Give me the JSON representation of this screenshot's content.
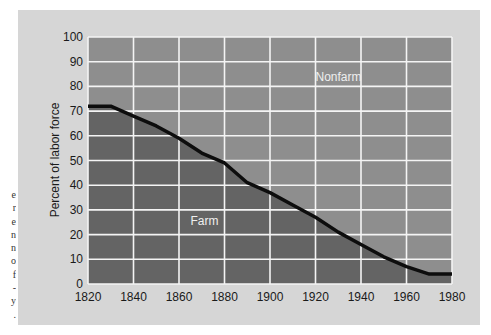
{
  "caption_fragment": [
    "e",
    "r",
    "e",
    "n",
    "n",
    "o",
    "f",
    "-",
    "y",
    "."
  ],
  "colors": {
    "panel_bg": "#d6d6d6",
    "nonfarm_fill": "#8e8e8e",
    "farm_fill": "#646464",
    "grid": "#f4f4f4",
    "line": "#0d0d0d"
  },
  "chart_data": {
    "type": "area",
    "title": "",
    "xlabel": "",
    "ylabel": "Percent of labor force",
    "xlim": [
      1820,
      1980
    ],
    "ylim": [
      0,
      100
    ],
    "x_ticks": [
      1820,
      1840,
      1860,
      1880,
      1900,
      1920,
      1940,
      1960,
      1980
    ],
    "y_ticks": [
      0,
      10,
      20,
      30,
      40,
      50,
      60,
      70,
      80,
      90,
      100
    ],
    "grid": true,
    "x": [
      1820,
      1830,
      1840,
      1850,
      1860,
      1870,
      1880,
      1890,
      1900,
      1910,
      1920,
      1930,
      1940,
      1950,
      1960,
      1970,
      1980
    ],
    "series": [
      {
        "name": "Farm",
        "values": [
          72,
          72,
          68,
          64,
          59,
          53,
          49,
          41,
          37,
          32,
          27,
          21,
          16,
          11,
          7,
          4,
          4
        ]
      },
      {
        "name": "Nonfarm",
        "values": [
          28,
          28,
          32,
          36,
          41,
          47,
          51,
          59,
          63,
          68,
          73,
          79,
          84,
          89,
          93,
          96,
          96
        ]
      }
    ],
    "annotations": [
      {
        "text": "Nonfarm",
        "x": 1920,
        "y": 82
      },
      {
        "text": "Farm",
        "x": 1865,
        "y": 24
      }
    ],
    "legend": "none (regions labeled inline)"
  }
}
